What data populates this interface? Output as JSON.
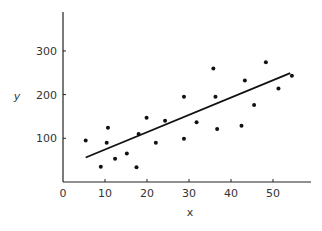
{
  "chart_data": {
    "type": "scatter",
    "title": "",
    "xlabel": "x",
    "ylabel": "y",
    "xlim": [
      0,
      58
    ],
    "ylim": [
      0,
      375
    ],
    "grid": false,
    "legend": null,
    "xticks": [
      0,
      10,
      20,
      30,
      40,
      50
    ],
    "yticks": [
      100,
      200,
      300
    ],
    "series": [
      {
        "name": "data",
        "kind": "scatter",
        "points": [
          {
            "x": 5.4,
            "y": 95
          },
          {
            "x": 9.0,
            "y": 35
          },
          {
            "x": 10.4,
            "y": 90
          },
          {
            "x": 10.7,
            "y": 124
          },
          {
            "x": 12.4,
            "y": 53
          },
          {
            "x": 15.2,
            "y": 65
          },
          {
            "x": 17.5,
            "y": 34
          },
          {
            "x": 18.0,
            "y": 110
          },
          {
            "x": 19.9,
            "y": 147
          },
          {
            "x": 22.1,
            "y": 90
          },
          {
            "x": 24.3,
            "y": 140
          },
          {
            "x": 28.8,
            "y": 99
          },
          {
            "x": 28.8,
            "y": 195
          },
          {
            "x": 31.8,
            "y": 137
          },
          {
            "x": 35.8,
            "y": 260
          },
          {
            "x": 36.3,
            "y": 195
          },
          {
            "x": 36.7,
            "y": 121
          },
          {
            "x": 42.5,
            "y": 129
          },
          {
            "x": 43.3,
            "y": 232
          },
          {
            "x": 45.5,
            "y": 176
          },
          {
            "x": 48.3,
            "y": 274
          },
          {
            "x": 51.3,
            "y": 214
          },
          {
            "x": 54.5,
            "y": 243
          }
        ]
      },
      {
        "name": "fit line",
        "kind": "line",
        "points": [
          {
            "x": 5.4,
            "y": 56
          },
          {
            "x": 54.1,
            "y": 249
          }
        ]
      }
    ],
    "colors": {
      "axis": "#222222",
      "points": "#111111",
      "line": "#111111",
      "text": "#333333"
    }
  }
}
